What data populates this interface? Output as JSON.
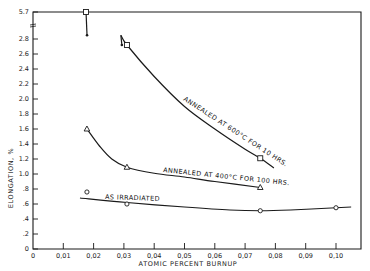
{
  "chart_data": {
    "type": "line",
    "title": "",
    "xlabel": "ATOMIC PERCENT BURNUP",
    "ylabel": "ELONGATION, %",
    "xlim": [
      0,
      0.11
    ],
    "ylim": [
      0,
      2.8
    ],
    "y_break": {
      "above": 2.8,
      "extra_tick": 5.7
    },
    "grid": false,
    "legend": "inline labels",
    "x_ticks": [
      "0",
      "0.01",
      "0.02",
      "0.03",
      "0.04",
      "0.05",
      "0.06",
      "0.07",
      "0.08",
      "0.09",
      "0.10"
    ],
    "y_ticks": [
      "0",
      ".2",
      ".4",
      ".6",
      ".8",
      "1.0",
      "1.2",
      "1.4",
      "1.6",
      "1.8",
      "2.0",
      "2.2",
      "2.4",
      "2.6",
      "2.8",
      "5.7"
    ],
    "series": [
      {
        "name": "ANNEALED AT 600°C FOR 10 HRS.",
        "marker": "square",
        "points": [
          {
            "x": 0.0175,
            "y": 5.7
          },
          {
            "x": 0.031,
            "y": 2.72
          },
          {
            "x": 0.075,
            "y": 1.21
          }
        ],
        "range_bars": [
          {
            "x": 0.0175,
            "from": 5.7,
            "to": 2.85
          },
          {
            "x": 0.029,
            "from": 2.85,
            "to": 2.72
          }
        ],
        "curve": [
          [
            0.029,
            2.85
          ],
          [
            0.031,
            2.72
          ],
          [
            0.04,
            2.3
          ],
          [
            0.05,
            1.9
          ],
          [
            0.06,
            1.6
          ],
          [
            0.07,
            1.33
          ],
          [
            0.075,
            1.21
          ],
          [
            0.0795,
            1.08
          ]
        ]
      },
      {
        "name": "ANNEALED AT 400°C FOR 100 HRS.",
        "marker": "triangle",
        "points": [
          {
            "x": 0.0178,
            "y": 1.6
          },
          {
            "x": 0.031,
            "y": 1.09
          },
          {
            "x": 0.075,
            "y": 0.82
          }
        ],
        "curve": [
          [
            0.0178,
            1.6
          ],
          [
            0.022,
            1.37
          ],
          [
            0.026,
            1.2
          ],
          [
            0.031,
            1.09
          ],
          [
            0.04,
            1.01
          ],
          [
            0.05,
            0.96
          ],
          [
            0.06,
            0.9
          ],
          [
            0.075,
            0.82
          ]
        ]
      },
      {
        "name": "AS IRRADIATED",
        "marker": "circle",
        "points": [
          {
            "x": 0.0178,
            "y": 0.76
          },
          {
            "x": 0.031,
            "y": 0.6
          },
          {
            "x": 0.075,
            "y": 0.51
          },
          {
            "x": 0.1,
            "y": 0.55
          }
        ],
        "curve": [
          [
            0.0155,
            0.68
          ],
          [
            0.031,
            0.62
          ],
          [
            0.05,
            0.56
          ],
          [
            0.065,
            0.52
          ],
          [
            0.075,
            0.51
          ],
          [
            0.085,
            0.52
          ],
          [
            0.1,
            0.55
          ],
          [
            0.105,
            0.56
          ]
        ]
      }
    ]
  }
}
